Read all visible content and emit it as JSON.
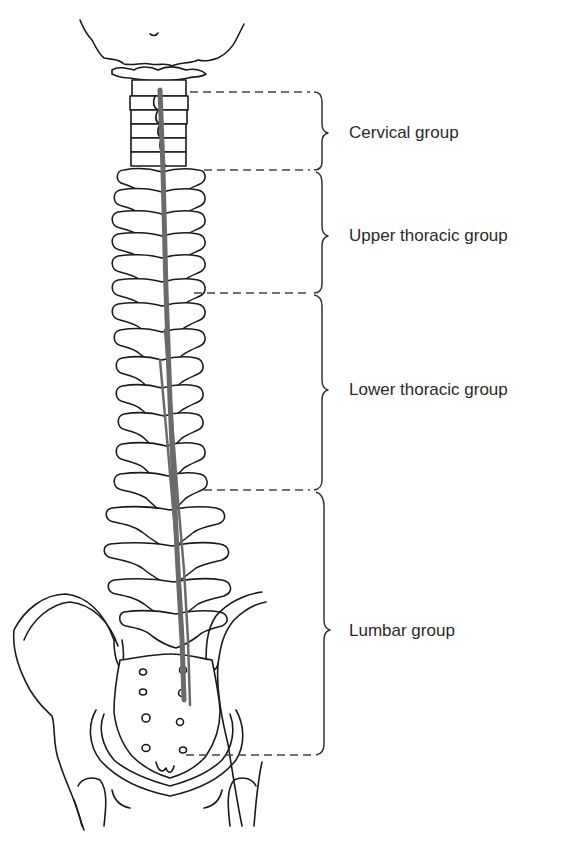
{
  "diagram": {
    "colors": {
      "line": "#1a1a1a",
      "muscle_band": "#6a6a6a",
      "dashed_leader": "#444444",
      "brace": "#333333",
      "label_text": "#2a2a2a",
      "background": "#ffffff"
    },
    "groups": [
      {
        "id": "cervical",
        "label": "Cervical group",
        "y_top": 92,
        "y_bottom": 170,
        "label_y": 133
      },
      {
        "id": "upper-thoracic",
        "label": "Upper thoracic group",
        "y_top": 170,
        "y_bottom": 293,
        "label_y": 236
      },
      {
        "id": "lower-thoracic",
        "label": "Lower thoracic group",
        "y_top": 293,
        "y_bottom": 490,
        "label_y": 390
      },
      {
        "id": "lumbar",
        "label": "Lumbar group",
        "y_top": 490,
        "y_bottom": 755,
        "label_y": 630
      }
    ]
  }
}
